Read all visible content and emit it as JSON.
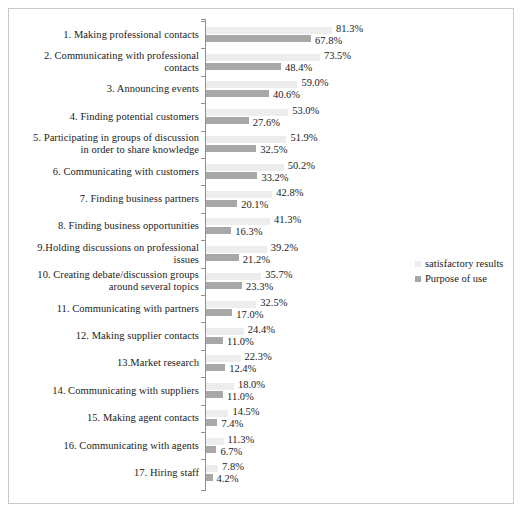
{
  "chart_data": {
    "type": "bar",
    "orientation": "horizontal",
    "title": "",
    "subtitle": "",
    "xlabel": "",
    "ylabel": "",
    "grid": false,
    "legend_position": "right-middle",
    "xlim": [
      0,
      81.3
    ],
    "categories": [
      "1. Making professional contacts",
      "2. Communicating with professional contacts",
      "3. Announcing events",
      "4. Finding potential customers",
      "5. Participating in groups of discussion in order to share knowledge",
      "6. Communicating with customers",
      "7. Finding business partners",
      "8. Finding business opportunities",
      "9.Holding discussions on professional issues",
      "10. Creating debate/discussion groups around several topics",
      "11. Communicating with partners",
      "12. Making supplier contacts",
      "13.Market research",
      "14. Communicating with suppliers",
      "15. Making agent contacts",
      "16. Communicating with agents",
      "17. Hiring staff"
    ],
    "series": [
      {
        "name": "satisfactory results",
        "color": "#ededed",
        "values": [
          81.3,
          73.5,
          59.0,
          53.0,
          51.9,
          50.2,
          42.8,
          41.3,
          39.2,
          35.7,
          32.5,
          24.4,
          22.3,
          18.0,
          14.5,
          11.3,
          7.8
        ],
        "labels": [
          "81.3%",
          "73.5%",
          "59.0%",
          "53.0%",
          "51.9%",
          "50.2%",
          "42.8%",
          "41.3%",
          "39.2%",
          "35.7%",
          "32.5%",
          "24.4%",
          "22.3%",
          "18.0%",
          "14.5%",
          "11.3%",
          "7.8%"
        ]
      },
      {
        "name": "Purpose of use",
        "color": "#a8a8a8",
        "values": [
          67.8,
          48.4,
          40.6,
          27.6,
          32.5,
          33.2,
          20.1,
          16.3,
          21.2,
          23.3,
          17.0,
          11.0,
          12.4,
          11.0,
          7.4,
          6.7,
          4.2
        ],
        "labels": [
          "67.8%",
          "48.4%",
          "40.6%",
          "27.6%",
          "32.5%",
          "33.2%",
          "20.1%",
          "16.3%",
          "21.2%",
          "23.3%",
          "17.0%",
          "11.0%",
          "12.4%",
          "11.0%",
          "7.4%",
          "6.7%",
          "4.2%"
        ]
      }
    ]
  },
  "legend": {
    "items": [
      {
        "label": "satisfactory results"
      },
      {
        "label": "Purpose of use"
      }
    ]
  }
}
